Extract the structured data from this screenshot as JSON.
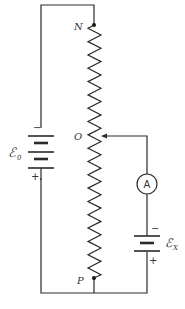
{
  "diagram": {
    "labels": {
      "node_top": "N",
      "node_mid": "O",
      "node_bottom": "P",
      "source_battery": "ℰ",
      "source_battery_sub": "0",
      "unknown_battery": "ℰ",
      "unknown_battery_sub": "X",
      "ammeter": "A",
      "minus": "−",
      "plus": "+"
    },
    "components": [
      {
        "id": "battery-e0",
        "type": "battery",
        "cells": 2
      },
      {
        "id": "resistor-np",
        "type": "slide-wire resistor"
      },
      {
        "id": "sliding-contact-o",
        "type": "contact"
      },
      {
        "id": "ammeter",
        "type": "ammeter"
      },
      {
        "id": "battery-ex",
        "type": "battery",
        "cells": 1
      }
    ],
    "colors": {
      "line": "#2a2a2a",
      "text": "#333333",
      "background": "#ffffff"
    }
  }
}
